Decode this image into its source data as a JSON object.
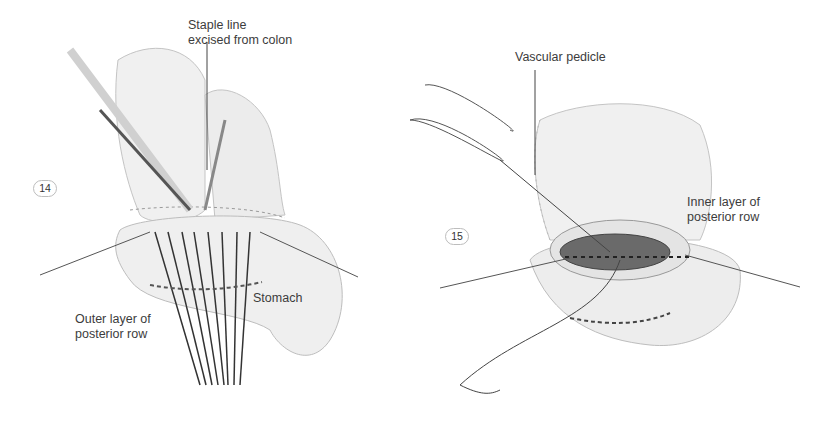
{
  "figures": [
    {
      "number": "14",
      "labels": {
        "staple_line": [
          "Staple line",
          "excised from colon"
        ],
        "stomach": "Stomach",
        "outer_layer": [
          "Outer layer of",
          "posterior row"
        ]
      }
    },
    {
      "number": "15",
      "labels": {
        "vascular_pedicle": "Vascular pedicle",
        "inner_layer": [
          "Inner layer of",
          "posterior row"
        ]
      }
    }
  ],
  "colors": {
    "background": "#ffffff",
    "label_text": "#3c3c3c",
    "tissue_fill": "#eeeeee",
    "tissue_stroke": "#b8b8b8",
    "suture": "#3a3a3a",
    "lumen": "#6a6a6a"
  }
}
